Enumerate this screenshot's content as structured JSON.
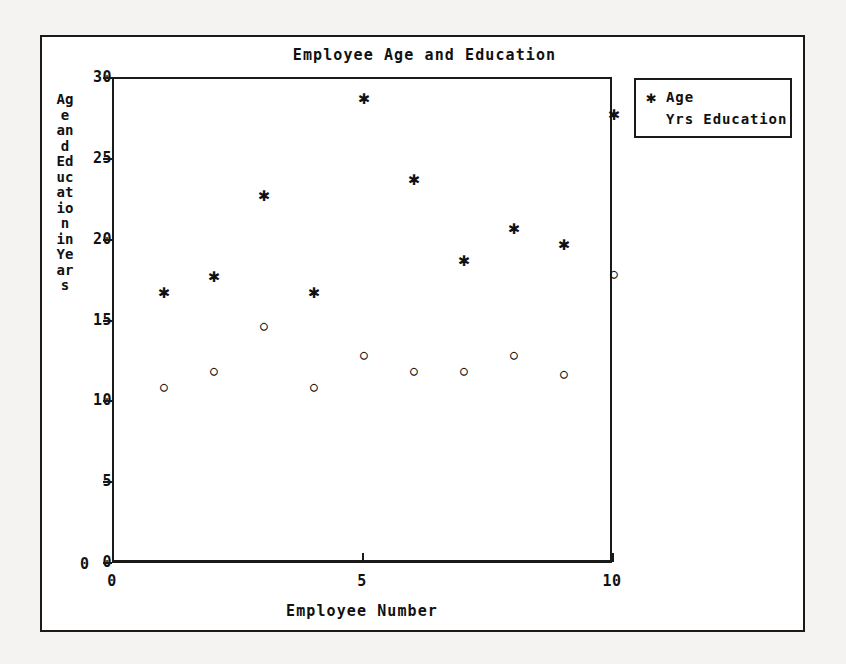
{
  "chart_data": {
    "type": "scatter",
    "title": "Employee Age and Education",
    "xlabel": "Employee Number",
    "ylabel": "Age and Education in Years",
    "xlim": [
      0,
      10
    ],
    "ylim": [
      0,
      30
    ],
    "xticks": [
      "0",
      "5",
      "10"
    ],
    "xtick_values": [
      0,
      5,
      10
    ],
    "yticks": [
      "0",
      "5",
      "10",
      "15",
      "20",
      "25",
      "30"
    ],
    "ytick_values": [
      0,
      5,
      10,
      15,
      20,
      25,
      30
    ],
    "grid": false,
    "legend_position": "outside-top-right",
    "x": [
      1,
      2,
      3,
      4,
      5,
      6,
      7,
      8,
      9,
      10
    ],
    "series": [
      {
        "name": "Age",
        "marker": "asterisk",
        "symbol": "✱",
        "values": [
          17,
          18,
          23,
          17,
          29,
          24,
          19,
          21,
          20,
          28
        ]
      },
      {
        "name": "Yrs Education",
        "marker": "circle",
        "symbol": "○",
        "values": [
          11,
          12,
          14.8,
          11,
          13,
          12,
          12,
          13,
          11.8,
          18
        ]
      }
    ]
  },
  "legend": {
    "entries": [
      {
        "symbol": "✱",
        "label": "Age"
      },
      {
        "symbol": "",
        "label": "Yrs Education"
      }
    ]
  },
  "axis": {
    "origin_label": "0"
  },
  "colors": {
    "ink": "#1a1a1a",
    "paper": "#ffffff",
    "page": "#f4f3f1"
  }
}
